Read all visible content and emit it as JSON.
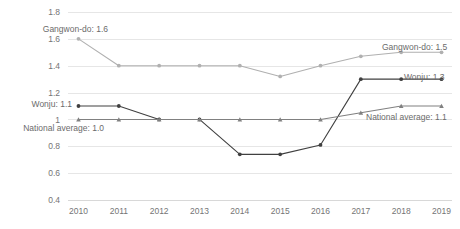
{
  "chart_data": {
    "type": "line",
    "title": "",
    "xlabel": "",
    "ylabel": "",
    "categories": [
      "2010",
      "2011",
      "2012",
      "2013",
      "2014",
      "2015",
      "2016",
      "2017",
      "2018",
      "2019"
    ],
    "ylim": [
      0.4,
      1.8
    ],
    "yticks": [
      "0.4",
      "0.6",
      "0.8",
      "1",
      "1.2",
      "1.4",
      "1.6",
      "1.8"
    ],
    "ytick_values": [
      0.4,
      0.6,
      0.8,
      1.0,
      1.2,
      1.4,
      1.6,
      1.8
    ],
    "grid": true,
    "legend": "none",
    "series": [
      {
        "name": "Gangwon-do",
        "color": "#b0b0b0",
        "marker": "circle",
        "values": [
          1.6,
          1.4,
          1.4,
          1.4,
          1.4,
          1.32,
          1.4,
          1.47,
          1.5,
          1.5
        ]
      },
      {
        "name": "Wonju",
        "color": "#404040",
        "marker": "circle",
        "values": [
          1.1,
          1.1,
          1.0,
          1.0,
          0.74,
          0.74,
          0.81,
          1.3,
          1.3,
          1.3
        ]
      },
      {
        "name": "National average",
        "color": "#808080",
        "marker": "triangle",
        "values": [
          1.0,
          1.0,
          1.0,
          1.0,
          1.0,
          1.0,
          1.0,
          1.05,
          1.1,
          1.1
        ]
      }
    ],
    "annotations": [
      {
        "id": "gangwon-start",
        "text": "Gangwon-do: 1.6",
        "side": "left",
        "x": 108,
        "y": 32
      },
      {
        "id": "wonju-start",
        "text": "Wonju: 1.1",
        "side": "left",
        "x": 72,
        "y": 107
      },
      {
        "id": "national-start",
        "text": "National average: 1.0",
        "side": "left",
        "x": 104,
        "y": 131
      },
      {
        "id": "gangwon-end",
        "text": "Gangwon-do: 1.5",
        "side": "right",
        "x": 382,
        "y": 50
      },
      {
        "id": "wonju-end",
        "text": "Wonju: 1.3",
        "side": "right",
        "x": 404,
        "y": 80
      },
      {
        "id": "national-end",
        "text": "National average: 1.1",
        "side": "right",
        "x": 366,
        "y": 120
      }
    ]
  },
  "corner": {
    "text": ""
  }
}
